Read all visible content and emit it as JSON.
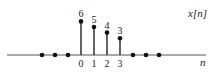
{
  "chart_data": {
    "type": "stem",
    "title": "",
    "signal_label": "x[n]",
    "xlabel": "n",
    "ylabel": "",
    "x": [
      -3,
      -2,
      -1,
      0,
      1,
      2,
      3,
      4,
      5,
      6
    ],
    "values": [
      0,
      0,
      0,
      6,
      5,
      4,
      3,
      0,
      0,
      0
    ],
    "data_labels": {
      "0": "6",
      "1": "5",
      "2": "4",
      "3": "3"
    },
    "x_tick_labels": [
      "0",
      "1",
      "2",
      "3"
    ],
    "x_ticks": [
      0,
      1,
      2,
      3
    ],
    "grid": false,
    "colors": {
      "stem": "#111111",
      "axis": "#555555",
      "text": "#1a1a1a"
    }
  }
}
